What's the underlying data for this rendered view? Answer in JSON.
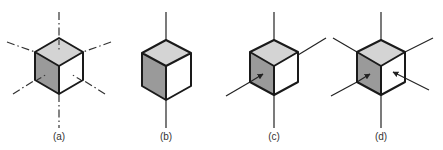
{
  "figure": {
    "panels": [
      {
        "id": "a",
        "label": "(a)",
        "cx": 59,
        "axes": "dash-dot",
        "arrows": []
      },
      {
        "id": "b",
        "label": "(b)",
        "cx": 166,
        "axes": "solid-vertical",
        "arrows": [
          "top"
        ]
      },
      {
        "id": "c",
        "label": "(c)",
        "cx": 274,
        "axes": "solid-two",
        "arrows": [
          "top",
          "left"
        ]
      },
      {
        "id": "d",
        "label": "(d)",
        "cx": 381,
        "axes": "solid-three",
        "arrows": [
          "top",
          "left",
          "right"
        ]
      }
    ],
    "colors": {
      "top_face": "#d4d4d4",
      "left_face": "#9a9a9a",
      "right_face": "#ffffff",
      "edge": "#1a1a1a",
      "axis": "#333333"
    }
  }
}
